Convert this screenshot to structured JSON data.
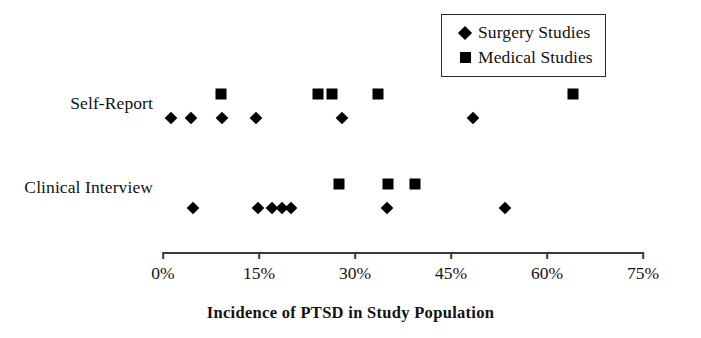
{
  "chart_data": {
    "type": "scatter",
    "title": "",
    "xlabel": "Incidence of PTSD in Study Population",
    "ylabel": "",
    "xlim": [
      0,
      75
    ],
    "xtick_labels": [
      "0%",
      "15%",
      "30%",
      "45%",
      "60%",
      "75%"
    ],
    "xticks": [
      0,
      15,
      30,
      45,
      60,
      75
    ],
    "categories": [
      "Self-Report",
      "Clinical Interview"
    ],
    "grid": false,
    "legend_position": "top-right",
    "series": [
      {
        "name": "Surgery Studies",
        "marker": "diamond",
        "color": "#000000",
        "points": [
          {
            "category": "Self-Report",
            "value": 1.3
          },
          {
            "category": "Self-Report",
            "value": 4.4
          },
          {
            "category": "Self-Report",
            "value": 9.2
          },
          {
            "category": "Self-Report",
            "value": 14.5
          },
          {
            "category": "Self-Report",
            "value": 28.0
          },
          {
            "category": "Self-Report",
            "value": 48.4
          },
          {
            "category": "Clinical Interview",
            "value": 4.7
          },
          {
            "category": "Clinical Interview",
            "value": 14.8
          },
          {
            "category": "Clinical Interview",
            "value": 17.0
          },
          {
            "category": "Clinical Interview",
            "value": 18.6
          },
          {
            "category": "Clinical Interview",
            "value": 20.0
          },
          {
            "category": "Clinical Interview",
            "value": 35.0
          },
          {
            "category": "Clinical Interview",
            "value": 53.4
          }
        ]
      },
      {
        "name": "Medical Studies",
        "marker": "square",
        "color": "#000000",
        "points": [
          {
            "category": "Self-Report",
            "value": 9.0
          },
          {
            "category": "Self-Report",
            "value": 24.2
          },
          {
            "category": "Self-Report",
            "value": 26.4
          },
          {
            "category": "Self-Report",
            "value": 33.6
          },
          {
            "category": "Self-Report",
            "value": 64.0
          },
          {
            "category": "Clinical Interview",
            "value": 27.5
          },
          {
            "category": "Clinical Interview",
            "value": 35.2
          },
          {
            "category": "Clinical Interview",
            "value": 39.4
          }
        ]
      }
    ]
  },
  "legend": {
    "entries": [
      {
        "label": "Surgery Studies",
        "marker": "diamond-marker-icon"
      },
      {
        "label": "Medical Studies",
        "marker": "square-marker-icon"
      }
    ]
  },
  "row_labels": {
    "self_report": "Self-Report",
    "clinical_interview": "Clinical Interview"
  },
  "axis": {
    "title": "Incidence of PTSD in Study Population"
  }
}
